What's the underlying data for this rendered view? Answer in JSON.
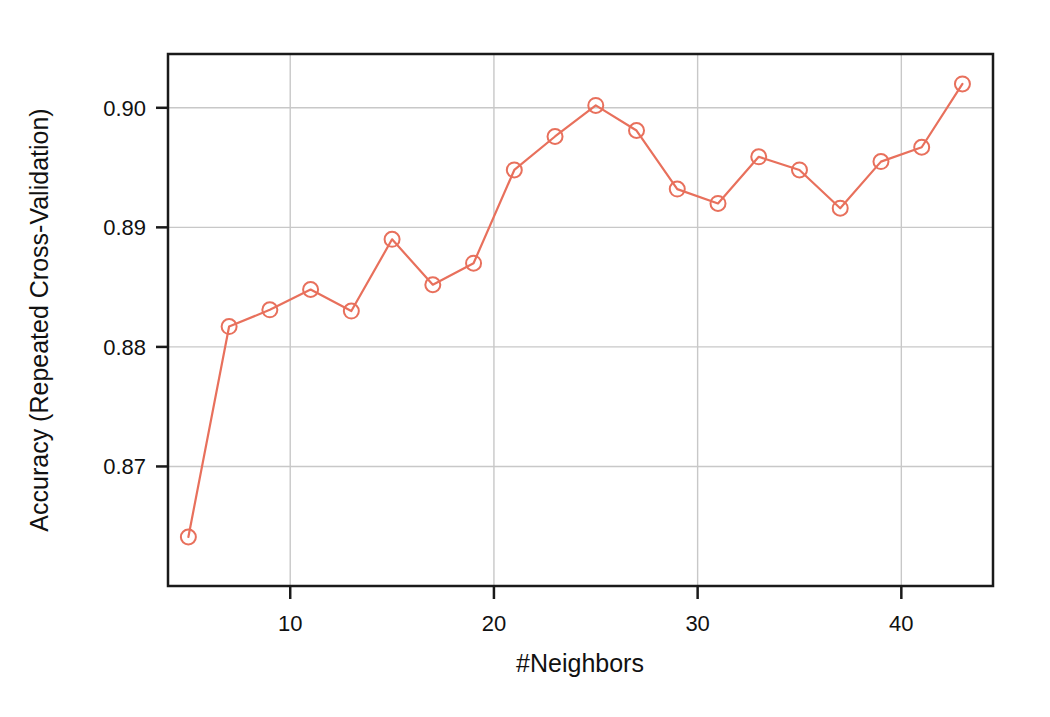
{
  "chart_data": {
    "type": "line",
    "title": "",
    "xlabel": "#Neighbors",
    "ylabel": "Accuracy (Repeated Cross-Validation)",
    "x": [
      5,
      7,
      9,
      11,
      13,
      15,
      17,
      19,
      21,
      23,
      25,
      27,
      29,
      31,
      33,
      35,
      37,
      39,
      41,
      43
    ],
    "values": [
      0.8641,
      0.8817,
      0.8831,
      0.8848,
      0.883,
      0.889,
      0.8852,
      0.887,
      0.8948,
      0.8976,
      0.9002,
      0.8981,
      0.8932,
      0.892,
      0.8959,
      0.8948,
      0.8916,
      0.8955,
      0.8967,
      0.902
    ],
    "series": [
      {
        "name": "Accuracy",
        "values": [
          0.8641,
          0.8817,
          0.8831,
          0.8848,
          0.883,
          0.889,
          0.8852,
          0.887,
          0.8948,
          0.8976,
          0.9002,
          0.8981,
          0.8932,
          0.892,
          0.8959,
          0.8948,
          0.8916,
          0.8955,
          0.8967,
          0.902
        ]
      }
    ],
    "xlim": [
      4.0,
      44.5
    ],
    "ylim": [
      0.86,
      0.9045
    ],
    "xticks": [
      10,
      20,
      30,
      40
    ],
    "xtick_labels": [
      "10",
      "20",
      "30",
      "40"
    ],
    "yticks": [
      0.87,
      0.88,
      0.89,
      0.9
    ],
    "ytick_labels": [
      "0.87",
      "0.88",
      "0.89",
      "0.90"
    ],
    "grid": true,
    "grid_color": "#c8c8c8",
    "legend": "none",
    "line_color": "#E8705C",
    "marker": "circle-open",
    "marker_color": "#E8705C",
    "frame_color": "#1a1a1a",
    "background": "#ffffff"
  }
}
